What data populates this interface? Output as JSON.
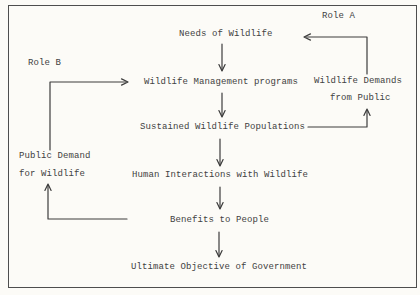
{
  "document": {
    "kind": "scanned typewritten flowchart",
    "colors": {
      "paper": "#fcfbf7",
      "ink": "#414141",
      "line": "#3c3c3c",
      "border": "#4e4e4e"
    },
    "roles": {
      "role_a": "Role A",
      "role_b": "Role B"
    },
    "nodes": {
      "needs": "Needs of Wildlife",
      "programs": "Wildlife Management programs",
      "demands_line1": "Wildlife Demands",
      "demands_line2": "from Public",
      "sustained": "Sustained Wildlife Populations",
      "public_demand_line1": "Public Demand",
      "public_demand_line2": "for Wildlife",
      "human": "Human Interactions with Wildlife",
      "benefits": "Benefits to People",
      "ultimate": "Ultimate Objective of Government"
    },
    "edges": [
      {
        "from": "Needs of Wildlife",
        "to": "Wildlife Management programs"
      },
      {
        "from": "Wildlife Management programs",
        "to": "Sustained Wildlife Populations"
      },
      {
        "from": "Sustained Wildlife Populations",
        "to": "Human Interactions with Wildlife"
      },
      {
        "from": "Human Interactions with Wildlife",
        "to": "Benefits to People"
      },
      {
        "from": "Benefits to People",
        "to": "Ultimate Objective of Government"
      },
      {
        "from": "Sustained Wildlife Populations",
        "to": "Wildlife Demands from Public"
      },
      {
        "from": "Wildlife Demands from Public",
        "to": "Needs of Wildlife",
        "loop_label": "Role A"
      },
      {
        "from": "Benefits to People",
        "to": "Public Demand for Wildlife"
      },
      {
        "from": "Public Demand for Wildlife",
        "to": "Wildlife Management programs",
        "loop_label": "Role B"
      }
    ]
  }
}
